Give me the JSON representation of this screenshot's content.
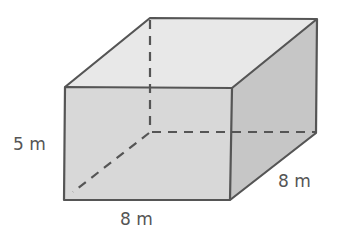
{
  "figure": {
    "type": "rectangular prism",
    "colors": {
      "top_face": "#e8e8e8",
      "front_face": "#d8d8d8",
      "side_face": "#c6c6c6",
      "edge": "#555555",
      "hidden_edge": "#555555",
      "label": "#555555"
    },
    "labels": {
      "height": "5 m",
      "length": "8 m",
      "width": "8 m"
    }
  }
}
